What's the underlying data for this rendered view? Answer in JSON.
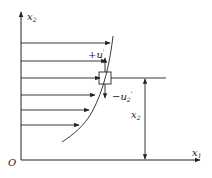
{
  "diagram": {
    "origin_label": "O",
    "axes": {
      "x": {
        "label": "x",
        "subscript": "1"
      },
      "y": {
        "label": "x",
        "subscript": "2"
      }
    },
    "fluctuation_labels": {
      "up": {
        "prefix": "+u",
        "subscript": "2",
        "prime": "'"
      },
      "down": {
        "prefix": "−u",
        "subscript": "2",
        "prime": "'"
      }
    },
    "dimension_label": {
      "label": "x",
      "subscript": "2"
    },
    "velocity_arrows": [
      {
        "y": 43,
        "tip_x": 110
      },
      {
        "y": 61,
        "tip_x": 106
      },
      {
        "y": 78,
        "tip_x": 100
      },
      {
        "y": 95,
        "tip_x": 95
      },
      {
        "y": 110,
        "tip_x": 89
      },
      {
        "y": 125,
        "tip_x": 79
      }
    ],
    "colors": {
      "stroke": "#222222",
      "background": "#ffffff"
    }
  }
}
